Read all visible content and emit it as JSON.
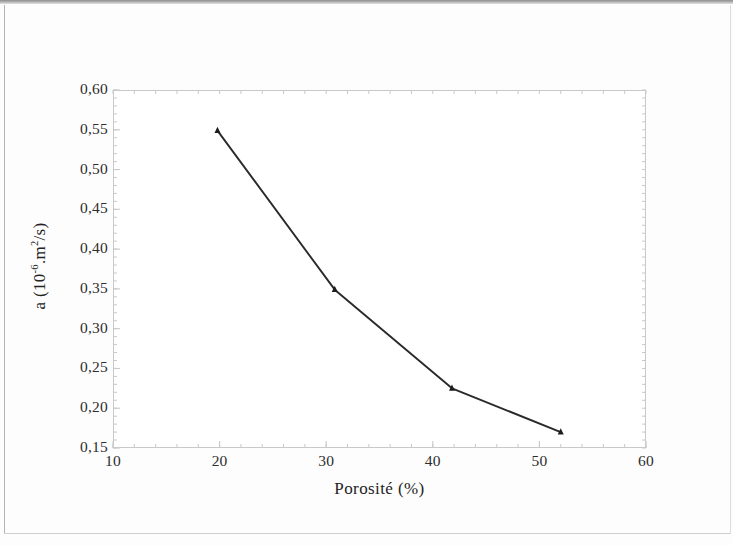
{
  "figure": {
    "axis_color": "#c9c9c9",
    "line_color": "#2a2a2a",
    "marker_color": "#1c1c1c",
    "text_color": "#2e2e2e"
  },
  "chart_data": {
    "type": "line",
    "title": "",
    "subtitle": "",
    "xlabel_text": "Porosité (%)",
    "xlabel_plain": "Porosite (%)",
    "ylabel_prefix": "a (10",
    "ylabel_exponent": "-6",
    "ylabel_suffix_a": ".m",
    "ylabel_exponent2": "2",
    "ylabel_suffix_b": "/s)",
    "ylabel_plain": "a (10-6.m2/s)",
    "xlim": [
      10,
      60
    ],
    "ylim": [
      0.15,
      0.6
    ],
    "x_major_step": 10,
    "x_minor_step": 2,
    "y_major_step": 0.05,
    "y_minor_step": 0.01,
    "grid": false,
    "legend": null,
    "legend_position": "none",
    "marker": "triangle-up",
    "xticks": [
      10,
      20,
      30,
      40,
      50,
      60
    ],
    "xtick_labels": [
      "10",
      "20",
      "30",
      "40",
      "50",
      "60"
    ],
    "yticks": [
      0.15,
      0.2,
      0.25,
      0.3,
      0.35,
      0.4,
      0.45,
      0.5,
      0.55,
      0.6
    ],
    "ytick_labels": [
      "0,15",
      "0,20",
      "0,25",
      "0,30",
      "0,35",
      "0,40",
      "0,45",
      "0,50",
      "0,55",
      "0,60"
    ],
    "series": [
      {
        "name": "a",
        "x": [
          19.8,
          30.8,
          41.8,
          52.0
        ],
        "values": [
          0.549,
          0.349,
          0.225,
          0.17
        ]
      }
    ]
  }
}
